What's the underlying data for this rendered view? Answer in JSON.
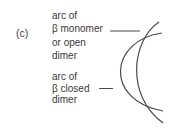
{
  "panel": {
    "label": "(c)"
  },
  "labels": {
    "monomer": {
      "lines": [
        "arc of",
        "β monomer",
        "or open",
        "dimer"
      ]
    },
    "closed": {
      "lines": [
        "arc of",
        "β closed",
        "dimer"
      ]
    }
  },
  "colors": {
    "text": "#3a3a3a",
    "arc": "#4a4a4a",
    "background": "#ffffff"
  }
}
